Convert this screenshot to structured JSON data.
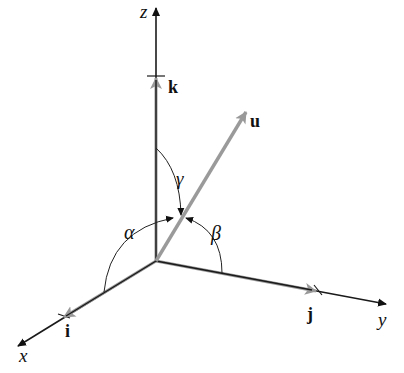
{
  "diagram": {
    "axes": {
      "x": {
        "label": "x",
        "unit_vector": "i"
      },
      "y": {
        "label": "y",
        "unit_vector": "j"
      },
      "z": {
        "label": "z",
        "unit_vector": "k"
      }
    },
    "vector": {
      "label": "u"
    },
    "angles": {
      "alpha": "α",
      "beta": "β",
      "gamma": "γ"
    },
    "colors": {
      "axis": "#1a1a1a",
      "unit_vector": "#999999",
      "vector_u": "#9a9a9a",
      "arc": "#222222"
    }
  }
}
